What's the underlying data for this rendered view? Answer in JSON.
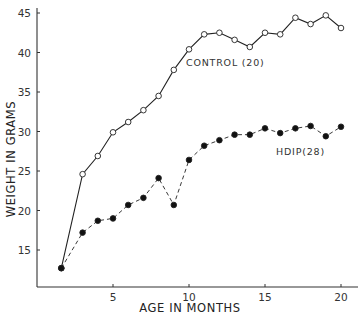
{
  "chart_data": {
    "type": "line",
    "title": "",
    "xlabel": "AGE IN MONTHS",
    "ylabel": "WEIGHT IN GRAMS",
    "xlim": [
      0.3,
      21.1
    ],
    "ylim": [
      10.2,
      45
    ],
    "x_ticks": [
      5,
      10,
      15,
      20
    ],
    "y_ticks": [
      15,
      20,
      25,
      30,
      35,
      40,
      45
    ],
    "grid": false,
    "legend": "inline labels",
    "series": [
      {
        "name": "CONTROL (20)",
        "marker": "open-circle",
        "line": "solid",
        "x": [
          1.6,
          3,
          4,
          5,
          6,
          7,
          8,
          9,
          10,
          11,
          12,
          13,
          14,
          15,
          16,
          17,
          18,
          19,
          20
        ],
        "values": [
          12.7,
          24.6,
          26.9,
          29.9,
          31.2,
          32.7,
          34.5,
          37.8,
          40.4,
          42.3,
          42.5,
          41.6,
          40.7,
          42.5,
          42.3,
          44.4,
          43.6,
          44.7,
          43.1
        ]
      },
      {
        "name": "HDIP(28)",
        "marker": "filled-circle",
        "line": "dashed",
        "x": [
          1.6,
          3,
          4,
          5,
          6,
          7,
          8,
          9,
          10,
          11,
          12,
          13,
          14,
          15,
          16,
          17,
          18,
          19,
          20
        ],
        "values": [
          12.7,
          17.2,
          18.7,
          19.0,
          20.7,
          21.6,
          24.1,
          20.7,
          26.4,
          28.2,
          28.9,
          29.6,
          29.6,
          30.4,
          29.8,
          30.4,
          30.7,
          29.4,
          30.6
        ]
      }
    ],
    "annotations": [
      {
        "text": "CONTROL (20)",
        "near_series": "CONTROL (20)"
      },
      {
        "text": "HDIP(28)",
        "near_series": "HDIP(28)"
      }
    ]
  }
}
